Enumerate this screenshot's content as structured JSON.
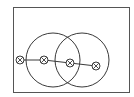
{
  "diagram": {
    "type": "geometry",
    "colors": {
      "background": "#ffffff",
      "stroke": "#3a3a3a",
      "frame": "#555555"
    },
    "frame": {
      "x": 13,
      "y": 7,
      "width": 116,
      "height": 85
    },
    "circles": [
      {
        "id": "circle-left",
        "cx": 53,
        "cy": 60,
        "r": 27
      },
      {
        "id": "circle-right",
        "cx": 82,
        "cy": 60,
        "r": 27
      }
    ],
    "markers": [
      {
        "id": "marker-1",
        "x": 20,
        "y": 60,
        "symbol": "⊗"
      },
      {
        "id": "marker-2",
        "x": 44,
        "y": 60,
        "symbol": "⊗"
      },
      {
        "id": "marker-3",
        "x": 70,
        "y": 63,
        "symbol": "⊗"
      },
      {
        "id": "marker-4",
        "x": 96,
        "y": 66,
        "symbol": "⊗"
      }
    ],
    "marker_radius": 4,
    "segments": [
      {
        "from": "marker-1",
        "to": "marker-2"
      },
      {
        "from": "marker-2",
        "to": "marker-3"
      },
      {
        "from": "marker-3",
        "to": "marker-4"
      }
    ]
  }
}
